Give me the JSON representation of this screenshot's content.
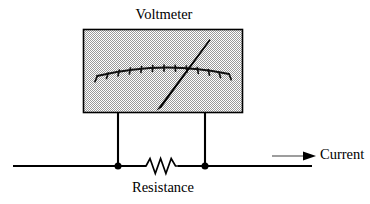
{
  "figure": {
    "type": "circuit-diagram",
    "width": 370,
    "height": 204,
    "background_color": "#ffffff",
    "line_color": "#000000"
  },
  "labels": {
    "voltmeter": "Voltmeter",
    "resistance": "Resistance",
    "current": "Current"
  },
  "meter": {
    "name": "Voltmeter",
    "box": {
      "x": 83,
      "y": 29,
      "width": 160,
      "height": 84
    },
    "fill_color": "#b9b9b9",
    "fill_pattern": "checkerboard-dither",
    "border_color": "#000000",
    "border_width": 1.5,
    "scale": {
      "kind": "arc",
      "major_tick_count": 3,
      "minor_tick_count": 12,
      "arc_color": "#000000"
    },
    "needle": {
      "kind": "tapered-pointer",
      "color": "#000000",
      "tip_x": 209,
      "tip_y": 40,
      "base_x": 160,
      "base_y": 110
    }
  },
  "circuit": {
    "main_wire": {
      "x1": 13,
      "y1": 166,
      "x2": 312,
      "y2": 166,
      "color": "#000000",
      "width": 2
    },
    "lead_left": {
      "x": 118,
      "y1": 113,
      "y2": 166,
      "color": "#000000",
      "width": 2
    },
    "lead_right": {
      "x": 205,
      "y1": 113,
      "y2": 166,
      "color": "#000000",
      "width": 2
    },
    "junction_nodes": [
      {
        "name": "left-node",
        "x": 118,
        "y": 166,
        "r": 3.4
      },
      {
        "name": "right-node",
        "x": 205,
        "y": 166,
        "r": 3.4
      }
    ],
    "resistor": {
      "kind": "zigzag",
      "peaks": 3,
      "x_start": 146,
      "x_end": 178,
      "center_y": 166,
      "amplitude": 7.5,
      "color": "#000000",
      "width": 1.6
    }
  },
  "current_arrow": {
    "shaft": {
      "x1": 272,
      "y1": 156,
      "x2": 304,
      "y2": 156
    },
    "shaft_color": "#808080",
    "head_color": "#000000",
    "head_x": 315,
    "head_y": 156,
    "direction": "right"
  },
  "colors": {
    "ink": "#000000",
    "meter_fill": "#b9b9b9",
    "arrow_shaft": "#808080",
    "paper": "#ffffff"
  }
}
